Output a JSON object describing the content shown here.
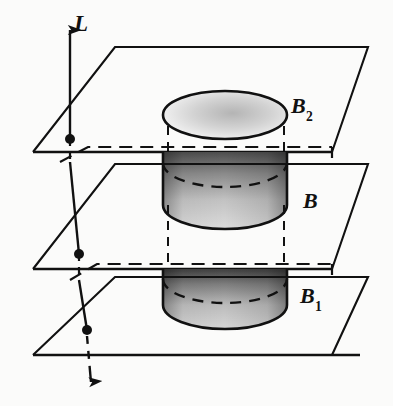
{
  "figure": {
    "background_color": "#fbfbfa",
    "stroke_color": "#111111",
    "labels": {
      "line": "L",
      "top_disk": "B",
      "top_disk_sub": "2",
      "middle_solid": "B",
      "lower_solid": "B",
      "lower_solid_sub": "1"
    },
    "elements": {
      "line_name": "L",
      "line_direction": "vertical",
      "arrow_top": "up-arrow",
      "arrow_bottom": "down-arrow",
      "plane_count": 3,
      "plane_shape": "parallelogram",
      "solid_shape": "cylinder",
      "intersection_dots": 3,
      "hidden_edge_style": "dashed"
    },
    "geometry": {
      "planes": [
        {
          "name": "top-plane",
          "points": "115,47 368,47 332,152 33,152",
          "dot": {
            "x": 70,
            "y": 139
          },
          "back_edge_dashed": "60,159 88,147 332,147 332,165"
        },
        {
          "name": "middle-plane",
          "points": "115,164 368,164 332,269 33,269",
          "dot": {
            "x": 79,
            "y": 254
          },
          "back_edge_dashed": "70,273 97,262 332,262 332,280"
        },
        {
          "name": "bottom-plane",
          "points": "115,277 368,277 332,355 33,355",
          "dot": {
            "x": 87,
            "y": 330
          },
          "back_edge_dashed": ""
        }
      ],
      "cylinder": {
        "left_x": 163,
        "right_x": 287,
        "center_x": 225,
        "top_ellipse_cy": 115,
        "ellipse_ry": 24,
        "ellipse_rx": 62,
        "middle_bottom_cy": 225,
        "lower_bottom_cy": 325,
        "shading": "gradient-dark-top-light-bottom"
      }
    },
    "colors": {
      "ink": "#111111",
      "cylinder_dark": "#6f6f6f",
      "cylinder_light": "#d9d9d9",
      "disk_fill": "#efefef",
      "disk_stipple": "#b9b9b9",
      "paper": "#fbfbfa"
    }
  }
}
